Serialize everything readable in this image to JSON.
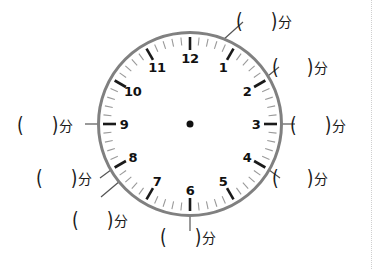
{
  "page": {
    "width": 380,
    "height": 269,
    "background": "#ffffff"
  },
  "page_edge": {
    "name": "page-edge-dotted-rule",
    "x": 371,
    "color": "#cfcfcf",
    "style": "dotted"
  },
  "clock": {
    "center": {
      "x": 190,
      "y": 124
    },
    "outer_radius": 93,
    "rim_color": "#808080",
    "rim_width": 3,
    "face_color": "#ffffff",
    "hub_color": "#111111",
    "hub_radius": 3.5,
    "numeral_radius": 66,
    "hour_tick": {
      "color": "#1a1a1a",
      "width": 2.6,
      "inner_radius": 74,
      "outer_radius": 87
    },
    "minute_tick": {
      "color": "#9a9a9a",
      "width": 1.1,
      "inner_radius": 79,
      "outer_radius": 87
    },
    "numerals": [
      {
        "label": "12",
        "hour": 12,
        "angle_deg": 0
      },
      {
        "label": "1",
        "hour": 1,
        "angle_deg": 30
      },
      {
        "label": "2",
        "hour": 2,
        "angle_deg": 60
      },
      {
        "label": "3",
        "hour": 3,
        "angle_deg": 90
      },
      {
        "label": "4",
        "hour": 4,
        "angle_deg": 120
      },
      {
        "label": "5",
        "hour": 5,
        "angle_deg": 150
      },
      {
        "label": "6",
        "hour": 6,
        "angle_deg": 180
      },
      {
        "label": "7",
        "hour": 7,
        "angle_deg": 210
      },
      {
        "label": "8",
        "hour": 8,
        "angle_deg": 240
      },
      {
        "label": "9",
        "hour": 9,
        "angle_deg": 270
      },
      {
        "label": "10",
        "hour": 10,
        "angle_deg": 300
      },
      {
        "label": "11",
        "hour": 11,
        "angle_deg": 330
      }
    ],
    "hands": []
  },
  "answer_blank": {
    "paren_open": "(",
    "paren_close": ")",
    "unit": "分",
    "value": ""
  },
  "callouts": [
    {
      "id": "callout-12",
      "name": "answer-blank-12-oclock",
      "hour_mark": 12,
      "minute_value": 0,
      "angle_deg": 0,
      "label_x": 236,
      "label_y": 13,
      "leader": {
        "x1": 223,
        "y1": 40,
        "x2": 243,
        "y2": 22
      }
    },
    {
      "id": "callout-1",
      "name": "answer-blank-1-oclock",
      "hour_mark": 1,
      "minute_value": 5,
      "angle_deg": 30,
      "label_x": 272,
      "label_y": 59,
      "leader": {
        "x1": 258,
        "y1": 84,
        "x2": 279,
        "y2": 67
      }
    },
    {
      "id": "callout-3",
      "name": "answer-blank-3-oclock",
      "hour_mark": 3,
      "minute_value": 15,
      "angle_deg": 90,
      "label_x": 290,
      "label_y": 117,
      "leader": {
        "x1": 275,
        "y1": 124,
        "x2": 295,
        "y2": 124
      }
    },
    {
      "id": "callout-4",
      "name": "answer-blank-4-oclock",
      "hour_mark": 4,
      "minute_value": 20,
      "angle_deg": 120,
      "label_x": 272,
      "label_y": 170,
      "leader": {
        "x1": 261,
        "y1": 164,
        "x2": 280,
        "y2": 178
      }
    },
    {
      "id": "callout-6",
      "name": "answer-blank-6-oclock",
      "hour_mark": 6,
      "minute_value": 30,
      "angle_deg": 180,
      "label_x": 160,
      "label_y": 229,
      "leader": {
        "x1": 190,
        "y1": 209,
        "x2": 190,
        "y2": 231
      }
    },
    {
      "id": "callout-7",
      "name": "answer-blank-7-oclock",
      "hour_mark": 7,
      "minute_value": 35,
      "angle_deg": 210,
      "label_x": 72,
      "label_y": 212,
      "leader": {
        "x1": 120,
        "y1": 181,
        "x2": 101,
        "y2": 197
      }
    },
    {
      "id": "callout-9",
      "name": "answer-blank-9-oclock",
      "hour_mark": 9,
      "minute_value": 45,
      "angle_deg": 270,
      "label_x": 17,
      "label_y": 117,
      "leader": {
        "x1": 85,
        "y1": 124,
        "x2": 105,
        "y2": 124
      }
    },
    {
      "id": "callout-10",
      "name": "answer-blank-10-oclock",
      "hour_mark": 10,
      "minute_value": 50,
      "angle_deg": 300,
      "label_x": 36,
      "label_y": 170,
      "leader": {
        "x1": 100,
        "y1": 178,
        "x2": 119,
        "y2": 164
      }
    }
  ]
}
